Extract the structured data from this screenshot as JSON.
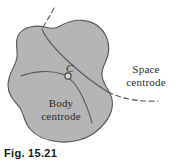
{
  "figure": {
    "caption": "Fig. 15.21",
    "background_color": "#ffffff"
  },
  "body_shape": {
    "name": "rigid-body-blob",
    "fill_color": "#b5b5b5",
    "stroke_color": "#545454"
  },
  "labels": {
    "point_c": "C",
    "space_centrode": "Space\ncentrode",
    "body_centrode": "Body\ncentrode"
  },
  "curves": {
    "space_centrode": {
      "name": "space-centrode-curve",
      "style": "dashed-outside-solid-inside",
      "color": "#5a5a5a"
    },
    "body_centrode": {
      "name": "body-centrode-curve",
      "style": "solid",
      "color": "#5a5a5a"
    }
  },
  "marker": {
    "point_c": {
      "name": "centrode-contact-point",
      "shape": "circle",
      "fill_color": "#d8d8d8",
      "stroke_color": "#3c3c3c"
    }
  }
}
